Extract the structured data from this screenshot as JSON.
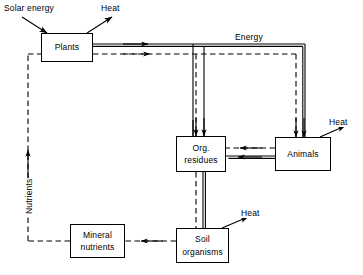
{
  "diagram": {
    "type": "flow-diagram",
    "width": 363,
    "height": 275,
    "background_color": "#ffffff",
    "line_color": "#000000",
    "nodes": [
      {
        "id": "plants",
        "label_lines": [
          "Plants"
        ],
        "x": 41,
        "y": 33,
        "w": 52,
        "h": 29
      },
      {
        "id": "org_residues",
        "label_lines": [
          "Org.",
          "residues"
        ],
        "x": 176,
        "y": 136,
        "w": 50,
        "h": 36
      },
      {
        "id": "animals",
        "label_lines": [
          "Animals"
        ],
        "x": 275,
        "y": 137,
        "w": 56,
        "h": 34
      },
      {
        "id": "mineral_nutrients",
        "label_lines": [
          "Mineral",
          "nutrients"
        ],
        "x": 70,
        "y": 224,
        "w": 55,
        "h": 34
      },
      {
        "id": "soil_organisms",
        "label_lines": [
          "Soil",
          "organisms"
        ],
        "x": 176,
        "y": 228,
        "w": 53,
        "h": 35
      }
    ],
    "labels": [
      {
        "id": "solar-energy",
        "text": "Solar energy",
        "x": 2,
        "y": 3,
        "orientation": "horizontal"
      },
      {
        "id": "heat-plants",
        "text": "Heat",
        "x": 99,
        "y": 3,
        "orientation": "horizontal"
      },
      {
        "id": "energy",
        "text": "Energy",
        "x": 233,
        "y": 32,
        "orientation": "horizontal"
      },
      {
        "id": "heat-animals",
        "text": "Heat",
        "x": 327,
        "y": 117,
        "orientation": "horizontal"
      },
      {
        "id": "heat-soil",
        "text": "Heat",
        "x": 239,
        "y": 208,
        "orientation": "horizontal"
      },
      {
        "id": "nutrients",
        "text": "Nutrients",
        "x": 24,
        "y": 215,
        "orientation": "vertical"
      }
    ],
    "flows": [
      {
        "id": "solar-to-plants",
        "style": "arrow",
        "from": "solar-energy-label",
        "to": "plants",
        "meaning": "solar energy input"
      },
      {
        "id": "plants-to-heat",
        "style": "arrow",
        "from": "plants",
        "to": "heat-plants-label",
        "meaning": "heat loss"
      },
      {
        "id": "plants-to-energy-bus",
        "style": "solid-double",
        "from": "plants",
        "to": "energy-bus",
        "meaning": "energy"
      },
      {
        "id": "plants-to-nutrient-bus",
        "style": "dashed",
        "from": "plants",
        "to": "nutrient-bus",
        "meaning": "nutrients"
      },
      {
        "id": "bus-to-org-residues-energy",
        "style": "solid-double",
        "from": "energy-bus",
        "to": "org_residues",
        "meaning": "energy"
      },
      {
        "id": "bus-to-org-residues-nutrients",
        "style": "dashed",
        "from": "nutrient-bus",
        "to": "org_residues",
        "meaning": "nutrients"
      },
      {
        "id": "bus-to-animals-energy",
        "style": "solid-double",
        "from": "energy-bus",
        "to": "animals",
        "meaning": "energy"
      },
      {
        "id": "bus-to-animals-nutrients",
        "style": "dashed",
        "from": "nutrient-bus",
        "to": "animals",
        "meaning": "nutrients"
      },
      {
        "id": "animals-to-org-residues-energy",
        "style": "solid-double",
        "from": "animals",
        "to": "org_residues",
        "meaning": "energy"
      },
      {
        "id": "animals-to-org-residues-nutrients",
        "style": "dashed",
        "from": "animals",
        "to": "org_residues",
        "meaning": "nutrients"
      },
      {
        "id": "animals-to-heat",
        "style": "arrow",
        "from": "animals",
        "to": "heat-animals-label",
        "meaning": "heat loss"
      },
      {
        "id": "org-residues-to-soil-energy",
        "style": "solid-double",
        "from": "org_residues",
        "to": "soil_organisms",
        "meaning": "energy"
      },
      {
        "id": "org-residues-to-soil-nutrients",
        "style": "dashed",
        "from": "org_residues",
        "to": "soil_organisms",
        "meaning": "nutrients"
      },
      {
        "id": "soil-to-heat",
        "style": "arrow",
        "from": "soil_organisms",
        "to": "heat-soil-label",
        "meaning": "heat loss"
      },
      {
        "id": "soil-to-mineral-nutrients",
        "style": "dashed",
        "from": "soil_organisms",
        "to": "mineral_nutrients",
        "meaning": "nutrients"
      },
      {
        "id": "mineral-nutrients-to-plants",
        "style": "dashed",
        "from": "mineral_nutrients",
        "to": "plants",
        "meaning": "nutrients"
      }
    ]
  }
}
